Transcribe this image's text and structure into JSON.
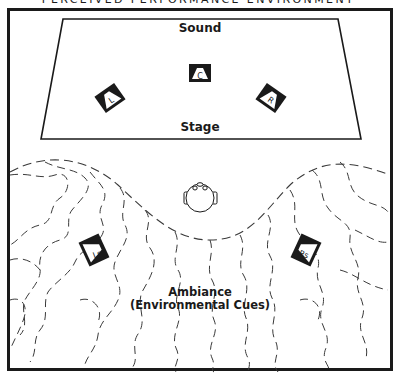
{
  "diagram": {
    "title": "PERCEIVED PERFORMANCE ENVIRONMENT",
    "stage": {
      "top_label": "Sound",
      "bottom_label": "Stage"
    },
    "speakers": [
      {
        "id": "C",
        "label": "C",
        "name": "center"
      },
      {
        "id": "L",
        "label": "L",
        "name": "left"
      },
      {
        "id": "R",
        "label": "R",
        "name": "right"
      },
      {
        "id": "Ls",
        "label": "Ls",
        "name": "left-surround"
      },
      {
        "id": "Rs",
        "label": "Rs",
        "name": "right-surround"
      }
    ],
    "listener": "head-icon",
    "ambiance": {
      "line1": "Ambiance",
      "line2": "(Environmental Cues)"
    },
    "colors": {
      "ink": "#1a1a1a",
      "background": "#ffffff",
      "dash": "#3a3a3a"
    }
  }
}
